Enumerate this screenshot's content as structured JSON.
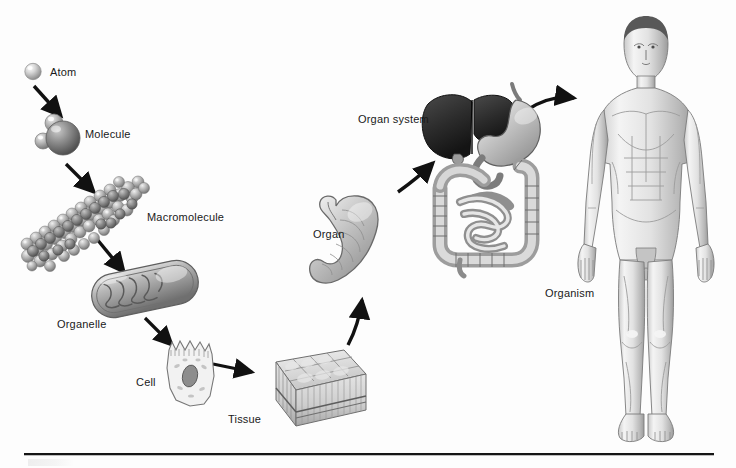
{
  "figure": {
    "background_color": "#fdfdfd",
    "label_color": "#1a1a1a",
    "arrow_color": "#111111",
    "rule_color": "#151515"
  },
  "levels": [
    {
      "id": "atom",
      "label": "Atom",
      "illustration": "single-sphere-atom",
      "label_x": 50,
      "label_y": 66
    },
    {
      "id": "molecule",
      "label": "Molecule",
      "illustration": "water-molecule-space-filling",
      "label_x": 85,
      "label_y": 128
    },
    {
      "id": "macromolecule",
      "label": "Macromolecule",
      "illustration": "protein-space-filling-chain",
      "label_x": 147,
      "label_y": 211
    },
    {
      "id": "organelle",
      "label": "Organelle",
      "illustration": "mitochondrion",
      "label_x": 57,
      "label_y": 318
    },
    {
      "id": "cell",
      "label": "Cell",
      "illustration": "epithelial-cell-with-nucleus",
      "label_x": 136,
      "label_y": 376
    },
    {
      "id": "tissue",
      "label": "Tissue",
      "illustration": "epithelial-tissue-block",
      "label_x": 228,
      "label_y": 413
    },
    {
      "id": "organ",
      "label": "Organ",
      "illustration": "stomach",
      "label_x": 313,
      "label_y": 228
    },
    {
      "id": "organ-system",
      "label": "Organ system",
      "illustration": "digestive-system-liver-stomach-intestines",
      "label_x": 358,
      "label_y": 113
    },
    {
      "id": "organism",
      "label": "Organism",
      "illustration": "human-male-anatomical-figure",
      "label_x": 545,
      "label_y": 287
    }
  ],
  "arrows": [
    {
      "id": "atom-to-molecule",
      "from": "atom",
      "to": "molecule",
      "style": "straight"
    },
    {
      "id": "molecule-to-macromolecule",
      "from": "molecule",
      "to": "macromolecule",
      "style": "straight"
    },
    {
      "id": "macromolecule-to-organelle",
      "from": "macromolecule",
      "to": "organelle",
      "style": "straight"
    },
    {
      "id": "organelle-to-cell",
      "from": "organelle",
      "to": "cell",
      "style": "straight"
    },
    {
      "id": "cell-to-tissue",
      "from": "cell",
      "to": "tissue",
      "style": "straight"
    },
    {
      "id": "tissue-to-organ",
      "from": "tissue",
      "to": "organ",
      "style": "curved"
    },
    {
      "id": "organ-to-organ-system",
      "from": "organ",
      "to": "organ-system",
      "style": "curved"
    },
    {
      "id": "organ-system-to-organism",
      "from": "organ-system",
      "to": "organism",
      "style": "curved"
    }
  ]
}
